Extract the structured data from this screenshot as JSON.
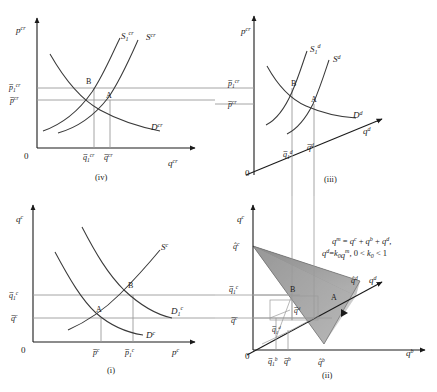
{
  "figure": {
    "type": "four-panel-economics-diagram"
  },
  "panels": [
    {
      "id": "iv",
      "caption": "(iv)",
      "position": "top-left",
      "origin_label": "0",
      "y_axis_label": "p",
      "y_axis_sup": "cr",
      "x_axis_label": "q",
      "x_axis_sup": "cr",
      "curves": [
        {
          "name": "S-1-cr",
          "base": "S",
          "sub": "1",
          "sup": "cr"
        },
        {
          "name": "S-cr",
          "base": "S",
          "sub": "",
          "sup": "cr"
        },
        {
          "name": "D-cr",
          "base": "D",
          "sub": "",
          "sup": "cr"
        }
      ],
      "points": [
        "B",
        "A"
      ],
      "y_ticks": [
        {
          "base": "p",
          "bar": true,
          "sub": "1",
          "sup": "cr"
        },
        {
          "base": "p",
          "bar": true,
          "sub": "",
          "sup": "cr"
        }
      ],
      "x_ticks": [
        {
          "base": "q",
          "bar": true,
          "sub": "1",
          "sup": "cr"
        },
        {
          "base": "q",
          "bar": true,
          "sub": "",
          "sup": "cr"
        }
      ]
    },
    {
      "id": "iii",
      "caption": "(iii)",
      "position": "top-right",
      "origin_label": "0",
      "y_axis_label": "p",
      "y_axis_sup": "cr",
      "x_axis_label": "q",
      "x_axis_sup": "d",
      "curves": [
        {
          "name": "S-1-d",
          "base": "S",
          "sub": "1",
          "sup": "d"
        },
        {
          "name": "S-d",
          "base": "S",
          "sub": "",
          "sup": "d"
        },
        {
          "name": "D-d",
          "base": "D",
          "sub": "",
          "sup": "d"
        }
      ],
      "points": [
        "B",
        "A"
      ],
      "y_ticks": [
        {
          "base": "p",
          "bar": true,
          "sub": "1",
          "sup": "cr"
        },
        {
          "base": "p",
          "bar": true,
          "sub": "",
          "sup": "cr"
        }
      ],
      "x_ticks": [
        {
          "base": "q",
          "bar": true,
          "sub": "1",
          "sup": "d"
        },
        {
          "base": "q",
          "bar": true,
          "sub": "",
          "sup": "d"
        }
      ]
    },
    {
      "id": "i",
      "caption": "(i)",
      "position": "bottom-left",
      "origin_label": "0",
      "y_axis_label": "q",
      "y_axis_sup": "c",
      "x_axis_label": "p",
      "x_axis_sup": "c",
      "curves": [
        {
          "name": "S-c",
          "base": "S",
          "sub": "",
          "sup": "c"
        },
        {
          "name": "D-1-c",
          "base": "D",
          "sub": "1",
          "sup": "c"
        },
        {
          "name": "D-c",
          "base": "D",
          "sub": "",
          "sup": "c"
        }
      ],
      "points": [
        "A",
        "B"
      ],
      "y_ticks": [
        {
          "base": "q",
          "bar": true,
          "sub": "1",
          "sup": "c"
        },
        {
          "base": "q",
          "bar": true,
          "sub": "",
          "sup": "c"
        }
      ],
      "x_ticks": [
        {
          "base": "p",
          "bar": true,
          "sub": "",
          "sup": "c"
        },
        {
          "base": "p",
          "bar": true,
          "sub": "1",
          "sup": "c"
        }
      ]
    },
    {
      "id": "ii",
      "caption": "(ii)",
      "position": "bottom-right",
      "origin_label": "0",
      "y_axis_label": "q",
      "y_axis_sup": "c",
      "x_axis_label": "q",
      "x_axis_sup": "b",
      "diag_axis_label": "q",
      "diag_axis_sup": "d",
      "points": [
        "B",
        "A"
      ],
      "y_ticks": [
        {
          "base": "q",
          "hat": true,
          "sub": "",
          "sup": "c"
        },
        {
          "base": "q",
          "bar": true,
          "sub": "1",
          "sup": "c"
        },
        {
          "base": "q",
          "bar": true,
          "sub": "",
          "sup": "c"
        }
      ],
      "x_ticks": [
        {
          "base": "q",
          "bar": true,
          "sub": "1",
          "sup": "b"
        },
        {
          "base": "q",
          "bar": true,
          "sub": "",
          "sup": "b"
        },
        {
          "base": "q",
          "hat": true,
          "sub": "",
          "sup": "b"
        }
      ],
      "diag_ticks": [
        {
          "base": "q",
          "hat": true,
          "sub": "",
          "sup": "d"
        }
      ],
      "inner_ticks": [
        {
          "base": "q",
          "bar": true,
          "sub": "",
          "sup": "d"
        },
        {
          "base": "q",
          "bar": true,
          "sub": "1",
          "sup": "d"
        }
      ],
      "equations": [
        "qᵐ = qᶜ + qᵇ + qᵈ,",
        "qᵈ = k₀qᵐ, 0 < k₀ < 1"
      ],
      "equation_parts": {
        "line1": {
          "lhs": "q",
          "lhs_sup": "m",
          "t1": "q",
          "t1_sup": "c",
          "t2": "q",
          "t2_sup": "b",
          "t3": "q",
          "t3_sup": "d"
        },
        "line2": {
          "lhs": "q",
          "lhs_sup": "d",
          "k": "k",
          "k_sub": "0",
          "rhs": "q",
          "rhs_sup": "m",
          "cond_lo": "0 <",
          "cond_k": "k",
          "cond_k_sub": "0",
          "cond_hi": "< 1"
        }
      }
    }
  ],
  "colors": {
    "curve": "#3a3a3a",
    "axis": "#1a1a1a",
    "guide": "#9a9a9a",
    "cone_dark": "#4a4a4a",
    "cone_mid": "#8f8f8f",
    "cone_light": "#b8b8b8",
    "text": "#1a1a1a"
  }
}
